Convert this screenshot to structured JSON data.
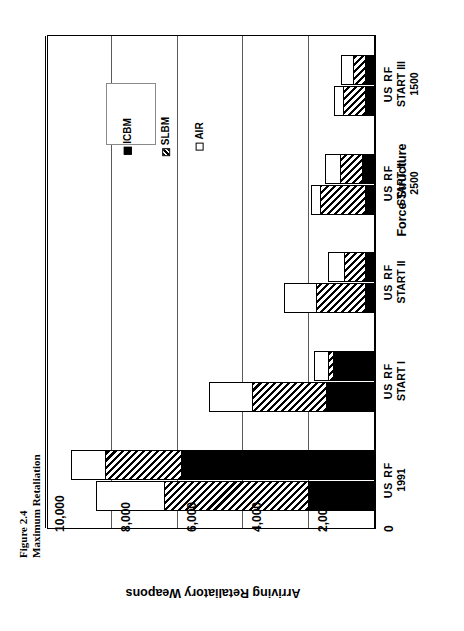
{
  "caption": {
    "figure_number": "Figure 2.4",
    "figure_title": "Maximum Retaliation"
  },
  "legend": {
    "items": [
      {
        "label": "AIR",
        "pattern": "solid-white",
        "color": "#ffffff"
      },
      {
        "label": "SLBM",
        "pattern": "diagonal-hatch",
        "color": "#000000"
      },
      {
        "label": "ICBM",
        "pattern": "solid-black",
        "color": "#000000"
      }
    ]
  },
  "axes": {
    "value_axis_title": "Arriving Retaliatory Weapons",
    "category_axis_title": "Force Structure",
    "value_ticks": [
      "10,000",
      "8,000",
      "6,000",
      "4,000",
      "2,000",
      "0"
    ],
    "value_tick_numbers": [
      10000,
      8000,
      6000,
      4000,
      2000,
      0
    ],
    "value_min": 0,
    "value_max": 10000,
    "grid": true,
    "orientation": "horizontal-bars-rotated"
  },
  "categories": [
    {
      "line1": "US  RF",
      "line2": "1991",
      "line3": ""
    },
    {
      "line1": "US  RF",
      "line2": "START I",
      "line3": ""
    },
    {
      "line1": "US  RF",
      "line2": "START II",
      "line3": ""
    },
    {
      "line1": "US  RF",
      "line2": "START III",
      "line3": "2500"
    },
    {
      "line1": "US  RF",
      "line2": "START III",
      "line3": "1500"
    }
  ],
  "chart_data": {
    "type": "bar",
    "title": "Maximum Retaliation",
    "subtitle": "Figure 2.4",
    "xlabel": "Force Structure",
    "ylabel": "Arriving Retaliatory Weapons",
    "ylim": [
      0,
      10000
    ],
    "grid": true,
    "legend_position": "inside-top-left",
    "orientation": "horizontal",
    "stacked": true,
    "categories": [
      "US RF 1991",
      "US RF START I",
      "US RF START II",
      "US RF START III 2500",
      "US RF START III 1500"
    ],
    "subgroups": [
      "US",
      "RF"
    ],
    "segments": [
      "ICBM",
      "SLBM",
      "AIR"
    ],
    "series": [
      {
        "name": "ICBM",
        "values_us": [
          5900,
          1280,
          300,
          400,
          300
        ],
        "values_rf": [
          2050,
          1490,
          300,
          300,
          300
        ]
      },
      {
        "name": "SLBM",
        "values_us": [
          2350,
          180,
          670,
          700,
          400
        ],
        "values_rf": [
          4400,
          2280,
          1520,
          1400,
          700
        ]
      },
      {
        "name": "AIR",
        "values_us": [
          1050,
          460,
          520,
          480,
          400
        ],
        "values_rf": [
          2100,
          1340,
          1010,
          300,
          300
        ]
      }
    ],
    "totals": {
      "US": [
        9300,
        1920,
        1490,
        1580,
        1100
      ],
      "RF": [
        8550,
        5110,
        2830,
        2000,
        1300
      ]
    }
  },
  "bars": [
    {
      "group": "US RF 1991",
      "us": [
        {
          "k": "icbm",
          "start": 0,
          "end": 5900
        },
        {
          "k": "slbm",
          "start": 5900,
          "end": 8250
        },
        {
          "k": "air",
          "start": 8250,
          "end": 9300
        }
      ],
      "rf": [
        {
          "k": "icbm",
          "start": 0,
          "end": 2050
        },
        {
          "k": "slbm",
          "start": 2050,
          "end": 6450
        },
        {
          "k": "air",
          "start": 6450,
          "end": 8550
        }
      ]
    },
    {
      "group": "US RF START I",
      "us": [
        {
          "k": "icbm",
          "start": 0,
          "end": 1280
        },
        {
          "k": "slbm",
          "start": 1280,
          "end": 1460
        },
        {
          "k": "air",
          "start": 1460,
          "end": 1920
        }
      ],
      "rf": [
        {
          "k": "icbm",
          "start": 0,
          "end": 1490
        },
        {
          "k": "slbm",
          "start": 1490,
          "end": 3770
        },
        {
          "k": "air",
          "start": 3770,
          "end": 5110
        }
      ]
    },
    {
      "group": "US RF START II",
      "us": [
        {
          "k": "icbm",
          "start": 0,
          "end": 300
        },
        {
          "k": "slbm",
          "start": 300,
          "end": 970
        },
        {
          "k": "air",
          "start": 970,
          "end": 1490
        }
      ],
      "rf": [
        {
          "k": "icbm",
          "start": 0,
          "end": 300
        },
        {
          "k": "slbm",
          "start": 300,
          "end": 1820
        },
        {
          "k": "air",
          "start": 1820,
          "end": 2830
        }
      ]
    },
    {
      "group": "US RF START III 2500",
      "us": [
        {
          "k": "icbm",
          "start": 0,
          "end": 400
        },
        {
          "k": "slbm",
          "start": 400,
          "end": 1100
        },
        {
          "k": "air",
          "start": 1100,
          "end": 1580
        }
      ],
      "rf": [
        {
          "k": "icbm",
          "start": 0,
          "end": 300
        },
        {
          "k": "slbm",
          "start": 300,
          "end": 1700
        },
        {
          "k": "air",
          "start": 1700,
          "end": 2000
        }
      ]
    },
    {
      "group": "US RF START III 1500",
      "us": [
        {
          "k": "icbm",
          "start": 0,
          "end": 300
        },
        {
          "k": "slbm",
          "start": 300,
          "end": 700
        },
        {
          "k": "air",
          "start": 700,
          "end": 1100
        }
      ],
      "rf": [
        {
          "k": "icbm",
          "start": 0,
          "end": 300
        },
        {
          "k": "slbm",
          "start": 300,
          "end": 1000
        },
        {
          "k": "air",
          "start": 1000,
          "end": 1300
        }
      ]
    }
  ]
}
